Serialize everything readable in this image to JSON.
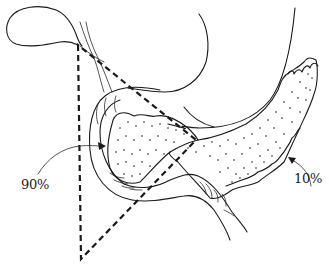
{
  "figure": {
    "structures": [
      "gallbladder",
      "cystic duct",
      "common bile duct",
      "stomach",
      "duodenum",
      "pancreas head",
      "pancreas body and tail"
    ],
    "labels": {
      "inside_triangle": "90%",
      "outside_triangle": "10%"
    },
    "triangle": {
      "style": "dashed",
      "vertices": [
        [
          78,
          45
        ],
        [
          81,
          259
        ],
        [
          196,
          140
        ]
      ]
    },
    "colors": {
      "line": "#1a1a1a",
      "background": "#ffffff"
    }
  }
}
